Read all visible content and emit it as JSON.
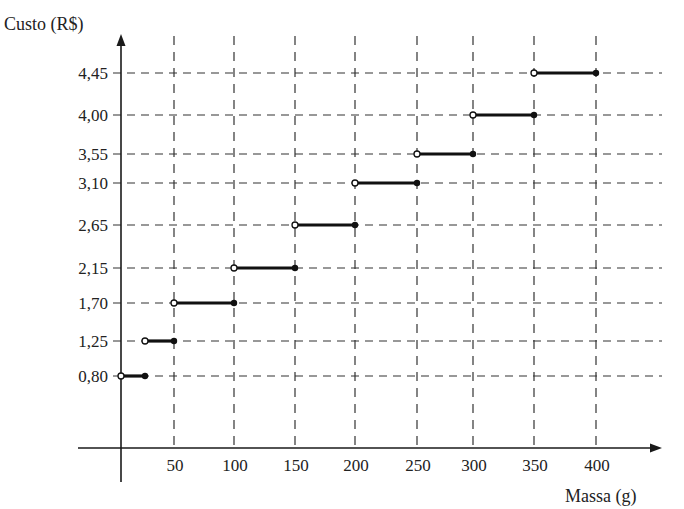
{
  "chart_data": {
    "type": "line",
    "subtype": "step-function",
    "title": "",
    "ylabel": "Custo (R$)",
    "xlabel": "Massa (g)",
    "x_ticks": [
      50,
      100,
      150,
      200,
      250,
      300,
      350,
      400
    ],
    "x_tick_labels": [
      "50",
      "100",
      "150",
      "200",
      "250",
      "300",
      "350",
      "400"
    ],
    "y_ticks": [
      0.8,
      1.25,
      1.7,
      2.15,
      2.65,
      3.1,
      3.55,
      4.0,
      4.45
    ],
    "y_tick_labels": [
      "0,80",
      "1,25",
      "1,70",
      "2,15",
      "2,65",
      "3,10",
      "3,55",
      "4,00",
      "4,45"
    ],
    "grid": "dashed",
    "segments": [
      {
        "x_start": 0,
        "x_end": 20,
        "y": 0.8,
        "start": "open",
        "end": "closed"
      },
      {
        "x_start": 20,
        "x_end": 50,
        "y": 1.25,
        "start": "open",
        "end": "closed"
      },
      {
        "x_start": 50,
        "x_end": 100,
        "y": 1.7,
        "start": "open",
        "end": "closed"
      },
      {
        "x_start": 100,
        "x_end": 150,
        "y": 2.15,
        "start": "open",
        "end": "closed"
      },
      {
        "x_start": 150,
        "x_end": 200,
        "y": 2.65,
        "start": "open",
        "end": "closed"
      },
      {
        "x_start": 200,
        "x_end": 250,
        "y": 3.1,
        "start": "open",
        "end": "closed"
      },
      {
        "x_start": 250,
        "x_end": 300,
        "y": 3.55,
        "start": "open",
        "end": "closed"
      },
      {
        "x_start": 300,
        "x_end": 350,
        "y": 4.0,
        "start": "open",
        "end": "closed"
      },
      {
        "x_start": 350,
        "x_end": 400,
        "y": 4.45,
        "start": "open",
        "end": "closed"
      }
    ]
  },
  "layout": {
    "origin": [
      121,
      448
    ],
    "x_pixel": {
      "0": 121,
      "20": 145,
      "50": 174,
      "100": 234,
      "150": 295,
      "200": 355,
      "250": 417,
      "300": 473,
      "350": 534,
      "400": 596
    },
    "y_pixel": {
      "0.8": 376,
      "1.25": 341,
      "1.7": 303,
      "2.15": 268,
      "2.65": 225,
      "3.1": 183,
      "3.55": 154,
      "4": 115,
      "4.45": 73
    },
    "colors": {
      "axis": "#1a1a1a",
      "grid": "#333333",
      "segment": "#111111",
      "background": "#ffffff"
    }
  }
}
